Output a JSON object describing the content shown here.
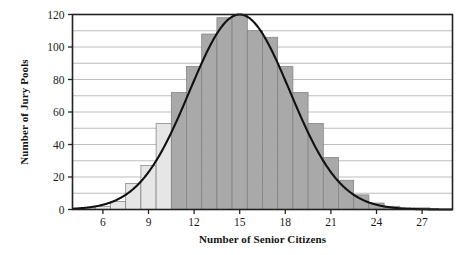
{
  "chart_data": {
    "type": "bar",
    "title": "",
    "subtitle": "",
    "xlabel": "Number of Senior Citizens",
    "ylabel": "Number of Jury Pools",
    "xlim": [
      4,
      29
    ],
    "ylim": [
      0,
      120
    ],
    "grid": true,
    "legend": null,
    "x_ticks": [
      6,
      9,
      12,
      15,
      18,
      21,
      24,
      27
    ],
    "x_tick_labels": [
      "6",
      "9",
      "12",
      "15",
      "18",
      "21",
      "24",
      "27"
    ],
    "y_ticks": [
      0,
      20,
      40,
      60,
      80,
      100,
      120
    ],
    "y_tick_labels": [
      "0",
      "20",
      "40",
      "60",
      "80",
      "100",
      "120"
    ],
    "y_minor_gridlines": [
      10,
      30,
      50,
      70,
      90,
      110
    ],
    "bar_width": 1,
    "categories": [
      4,
      5,
      6,
      7,
      8,
      9,
      10,
      11,
      12,
      13,
      14,
      15,
      16,
      17,
      18,
      19,
      20,
      21,
      22,
      23,
      24,
      25,
      26,
      27,
      28
    ],
    "values": [
      0,
      1,
      2,
      5,
      16,
      27,
      53,
      72,
      88,
      108,
      118,
      120,
      110,
      106,
      88,
      72,
      53,
      32,
      18,
      9,
      4,
      2,
      1,
      1,
      0
    ],
    "bar_shades": [
      "light",
      "light",
      "light",
      "light",
      "light",
      "light",
      "light",
      "dark",
      "dark",
      "dark",
      "dark",
      "dark",
      "dark",
      "dark",
      "dark",
      "dark",
      "dark",
      "dark",
      "dark",
      "dark",
      "dark",
      "dark",
      "dark",
      "dark",
      "dark"
    ],
    "overlay_curve": {
      "type": "normal-density",
      "mean": 15,
      "sigma": 3.3,
      "peak": 120,
      "description": "normal curve overlay"
    },
    "colors": {
      "bar_dark": "#a9a9a9",
      "bar_light": "#e6e6e6",
      "bar_edge": "#7d7d7d",
      "curve": "#111111",
      "axis": "#222222",
      "gridline": "#b5b5b5",
      "background": "#ffffff",
      "text": "#141414"
    }
  }
}
